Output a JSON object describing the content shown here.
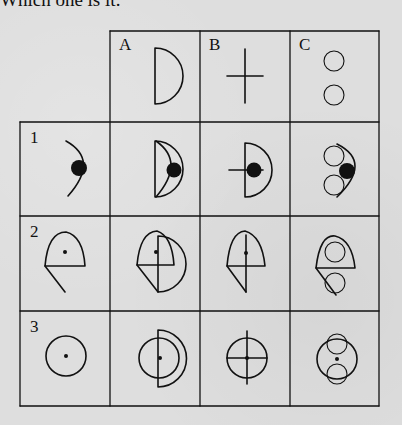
{
  "prompt": "Which one is it:",
  "columns": [
    {
      "label": "A",
      "shape": "half-disc (D shape)"
    },
    {
      "label": "B",
      "shape": "plus / cross"
    },
    {
      "label": "C",
      "shape": "two small circles stacked"
    }
  ],
  "rows": [
    {
      "label": "1",
      "shape": "arc with black filled dot"
    },
    {
      "label": "2",
      "shape": "rounded dome with horizontal base, diagonal tail and small dot"
    },
    {
      "label": "3",
      "shape": "circle with small center dot"
    }
  ],
  "cells": [
    [
      "row1 + A",
      "row1 + B",
      "row1 + C"
    ],
    [
      "row2 + A",
      "row2 + B",
      "row2 + C"
    ],
    [
      "row3 + A",
      "row3 + B",
      "row3 + C"
    ]
  ],
  "colors": {
    "ink": "#111111",
    "paper": "#dedede"
  }
}
